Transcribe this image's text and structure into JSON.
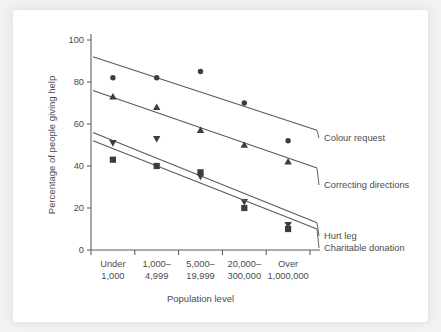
{
  "chart_data": {
    "type": "scatter",
    "title": "",
    "xlabel": "Population level",
    "ylabel": "Percentage of people giving help",
    "categories": [
      "Under\n1,000",
      "1,000–\n4,999",
      "5,000–\n19,999",
      "20,000–\n300,000",
      "Over\n1,000,000"
    ],
    "category_lines": [
      [
        "Under",
        "1,000"
      ],
      [
        "1,000–",
        "4,999"
      ],
      [
        "5,000–",
        "19,999"
      ],
      [
        "20,000–",
        "300,000"
      ],
      [
        "Over",
        "1,000,000"
      ]
    ],
    "ylim": [
      0,
      100
    ],
    "yticks": [
      0,
      20,
      40,
      60,
      80,
      100
    ],
    "ytick_labels": [
      "0",
      "20",
      "40",
      "60",
      "80",
      "100"
    ],
    "grid": false,
    "legend_position": "right-inline-labels",
    "series": [
      {
        "name": "Colour request",
        "marker": "circle",
        "color": "#3d3d3f",
        "values": [
          82,
          82,
          85,
          70,
          52
        ],
        "trend_start": 92,
        "trend_end": 57
      },
      {
        "name": "Correcting directions",
        "marker": "triangle-up",
        "color": "#3d3d3f",
        "values": [
          73,
          68,
          57,
          50,
          42
        ],
        "trend_start": 76,
        "trend_end": 39
      },
      {
        "name": "Hurt leg",
        "marker": "triangle-down",
        "color": "#3d3d3f",
        "values": [
          51,
          53,
          35,
          23,
          12
        ],
        "trend_start": 56,
        "trend_end": 13
      },
      {
        "name": "Charitable donation",
        "marker": "square",
        "color": "#3d3d3f",
        "values": [
          43,
          40,
          37,
          20,
          10
        ],
        "trend_start": 52,
        "trend_end": 10
      }
    ]
  },
  "figure": {
    "axis_color": "#58585a",
    "marker_color": "#3d3d3f",
    "text_color": "#4b4b4d",
    "panel_background": "#ffffff",
    "page_background": "#f2f2f2"
  }
}
